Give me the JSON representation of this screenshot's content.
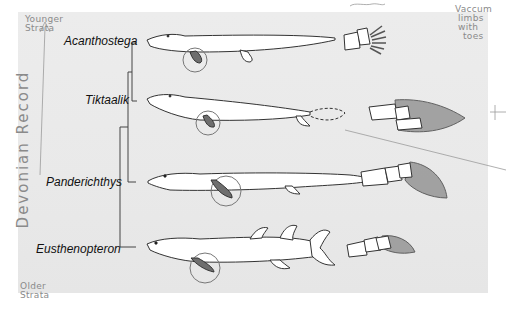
{
  "figure": {
    "taxa": [
      {
        "name": "Acanthostega",
        "appendage": "limb with digits"
      },
      {
        "name": "Tiktaalik",
        "appendage": "transitional fin with wrist bones"
      },
      {
        "name": "Panderichthys",
        "appendage": "lobed fin"
      },
      {
        "name": "Eusthenopteron",
        "appendage": "lobed fin"
      }
    ]
  },
  "annotations": {
    "top_left": [
      "Younger",
      "Strata"
    ],
    "bottom_left": [
      "Older",
      "Strata"
    ],
    "vertical": "Devonian Record",
    "top_right": [
      "Vaccum",
      "limbs",
      "with",
      "toes"
    ]
  },
  "colors": {
    "panel": "#ebebeb",
    "outline": "#333333",
    "fin_fill": "#7a7a7a",
    "pencil": "#8a8a8a"
  }
}
